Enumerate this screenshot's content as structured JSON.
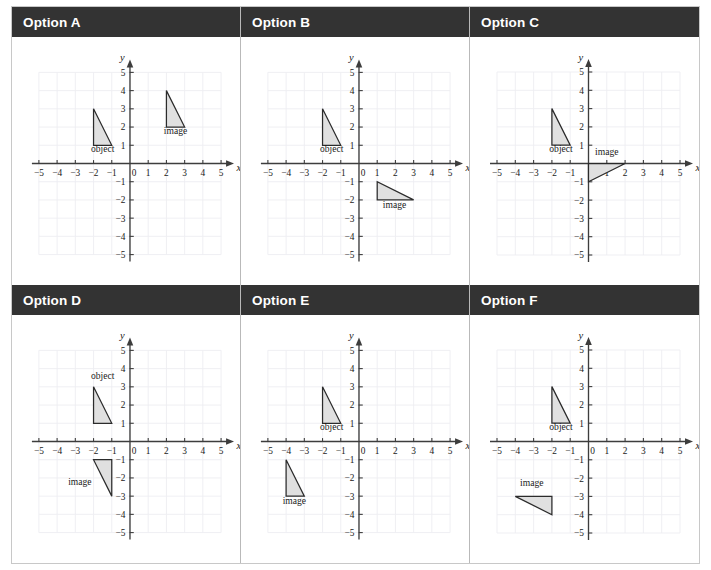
{
  "page": {
    "columns": 3,
    "rows": 2
  },
  "style": {
    "banner_background": "#333333",
    "banner_text_color": "#ffffff",
    "page_background": "#ffffff",
    "border_color": "#c8c8c8",
    "divider_color": "#b9b9b9",
    "grid_line_color": "#ededf2",
    "axis_color": "#3d3d3d",
    "shape_fill": "#e0e0e0",
    "shape_stroke": "#2b2b2b"
  },
  "axes": {
    "x_label": "x",
    "y_label": "y",
    "x_min": -5,
    "x_max": 5,
    "y_min": -5,
    "y_max": 5,
    "x_tick_labels": [
      "−5",
      "−4",
      "−3",
      "−2",
      "−1",
      "0",
      "1",
      "2",
      "3",
      "4",
      "5"
    ],
    "y_tick_labels": [
      "5",
      "4",
      "3",
      "2",
      "1",
      "0",
      "−1",
      "−2",
      "−3",
      "−4",
      "−5"
    ],
    "origin_label": "0",
    "grid": true
  },
  "labels": {
    "object": "object",
    "image": "image"
  },
  "chart_data": {
    "type": "scatter",
    "xlabel": "x",
    "ylabel": "y",
    "xlim": [
      -5,
      5
    ],
    "ylim": [
      -5,
      5
    ],
    "grid": true,
    "panels": [
      {
        "id": "A",
        "banner": "Option A",
        "shapes": [
          {
            "name": "object",
            "label": "object",
            "vertices": [
              [
                -2,
                3
              ],
              [
                -2,
                1
              ],
              [
                -1,
                1
              ]
            ],
            "label_at": [
              -1.5,
              0.62
            ]
          },
          {
            "name": "image",
            "label": "image",
            "vertices": [
              [
                2,
                4
              ],
              [
                2,
                2
              ],
              [
                3,
                2
              ]
            ],
            "label_at": [
              2.5,
              1.62
            ]
          }
        ]
      },
      {
        "id": "B",
        "banner": "Option B",
        "shapes": [
          {
            "name": "object",
            "label": "object",
            "vertices": [
              [
                -2,
                3
              ],
              [
                -2,
                1
              ],
              [
                -1,
                1
              ]
            ],
            "label_at": [
              -1.5,
              0.62
            ]
          },
          {
            "name": "image",
            "label": "image",
            "vertices": [
              [
                1,
                -1
              ],
              [
                1,
                -2
              ],
              [
                3,
                -2
              ]
            ],
            "label_at": [
              1.95,
              -2.42
            ]
          }
        ]
      },
      {
        "id": "C",
        "banner": "Option C",
        "shapes": [
          {
            "name": "object",
            "label": "object",
            "vertices": [
              [
                -2,
                3
              ],
              [
                -2,
                1
              ],
              [
                -1,
                1
              ]
            ],
            "label_at": [
              -1.5,
              0.62
            ]
          },
          {
            "name": "image",
            "label": "image",
            "vertices": [
              [
                0,
                0
              ],
              [
                0,
                -1
              ],
              [
                2,
                0
              ]
            ],
            "label_at": [
              1.0,
              0.48
            ]
          }
        ]
      },
      {
        "id": "D",
        "banner": "Option D",
        "shapes": [
          {
            "name": "object",
            "label": "object",
            "vertices": [
              [
                -2,
                3
              ],
              [
                -2,
                1
              ],
              [
                -1,
                1
              ]
            ],
            "label_at": [
              -1.5,
              3.42
            ]
          },
          {
            "name": "image",
            "label": "image",
            "vertices": [
              [
                -2,
                -1
              ],
              [
                -1,
                -1
              ],
              [
                -1,
                -3
              ]
            ],
            "label_at": [
              -2.75,
              -2.38
            ]
          }
        ]
      },
      {
        "id": "E",
        "banner": "Option E",
        "shapes": [
          {
            "name": "object",
            "label": "object",
            "vertices": [
              [
                -2,
                3
              ],
              [
                -2,
                1
              ],
              [
                -1,
                1
              ]
            ],
            "label_at": [
              -1.5,
              0.62
            ]
          },
          {
            "name": "image",
            "label": "image",
            "vertices": [
              [
                -4,
                -1
              ],
              [
                -4,
                -3
              ],
              [
                -3,
                -3
              ]
            ],
            "label_at": [
              -3.55,
              -3.42
            ]
          }
        ]
      },
      {
        "id": "F",
        "banner": "Option F",
        "shapes": [
          {
            "name": "object",
            "label": "object",
            "vertices": [
              [
                -2,
                3
              ],
              [
                -2,
                1
              ],
              [
                -1,
                1
              ]
            ],
            "label_at": [
              -1.5,
              0.62
            ]
          },
          {
            "name": "image",
            "label": "image",
            "vertices": [
              [
                -4,
                -3
              ],
              [
                -2,
                -3
              ],
              [
                -2,
                -4
              ]
            ],
            "label_at": [
              -3.1,
              -2.45
            ]
          }
        ]
      }
    ]
  }
}
